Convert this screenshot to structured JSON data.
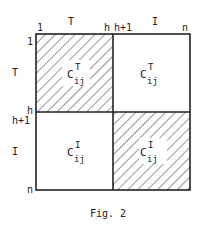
{
  "figure": {
    "caption": "Fig. 2",
    "top_labels": {
      "start": "1",
      "group_T": "T",
      "h": "h",
      "h_plus_1": "h+1",
      "group_I": "I",
      "n": "n"
    },
    "left_labels": {
      "start": "1",
      "group_T": "T",
      "h": "h",
      "h_plus_1": "h+1",
      "group_I": "I",
      "n": "n"
    },
    "blocks": [
      {
        "id": "top-left",
        "base": "C",
        "sup": "T",
        "sub": "ij",
        "hatched": true
      },
      {
        "id": "top-right",
        "base": "C",
        "sup": "T",
        "sub": "ij",
        "hatched": false
      },
      {
        "id": "bottom-left",
        "base": "C",
        "sup": "I",
        "sub": "ij",
        "hatched": false
      },
      {
        "id": "bottom-right",
        "base": "C",
        "sup": "I",
        "sub": "ij",
        "hatched": true
      }
    ],
    "colors": {
      "ink": "#222222",
      "background": "#ffffff"
    }
  }
}
